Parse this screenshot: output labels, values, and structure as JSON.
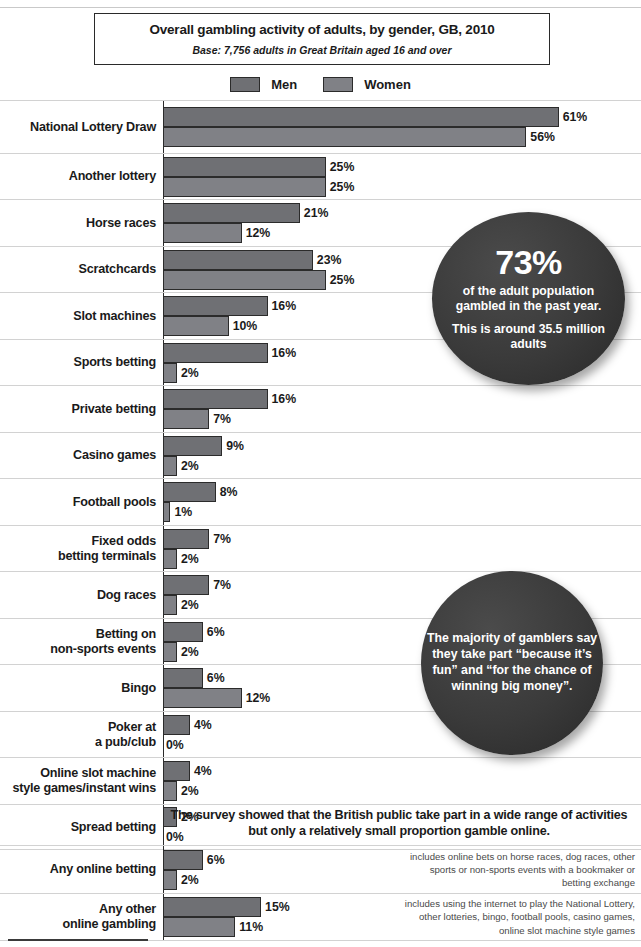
{
  "title": {
    "main": "Overall gambling activity of adults, by gender, GB, 2010",
    "subtitle": "Base: 7,756 adults in Great Britain aged 16 and over"
  },
  "legend": {
    "men_label": "Men",
    "women_label": "Women",
    "men_color": "#6f7074",
    "women_color": "#808186"
  },
  "callouts": [
    {
      "id": "callout-1",
      "big": "73%",
      "line1": "of the adult population gambled in the past year.",
      "line2": "This is around 35.5 million adults"
    },
    {
      "id": "callout-2",
      "big": "",
      "line1": "The majority of gamblers say they take part “because it’s fun” and “for the chance of winning big money”.",
      "line2": ""
    }
  ],
  "online_note": "The survey showed that the British public take part in a wide range of activities but only a relatively small proportion gamble online.",
  "chart_data": {
    "type": "bar",
    "orientation": "horizontal",
    "title": "Overall gambling activity of adults, by gender, GB, 2010",
    "subtitle": "Base: 7,756 adults in Great Britain aged 16 and over",
    "xlabel": "",
    "ylabel": "",
    "xlim": [
      0,
      61
    ],
    "grid": true,
    "legend_position": "top-center",
    "value_suffix": "%",
    "categories": [
      "National Lottery Draw",
      "Another lottery",
      "Horse races",
      "Scratchcards",
      "Slot machines",
      "Sports betting",
      "Private betting",
      "Casino games",
      "Football pools",
      "Fixed odds betting terminals",
      "Dog races",
      "Betting on non-sports events",
      "Bingo",
      "Poker at a pub/club",
      "Online slot machine style games/instant wins",
      "Spread betting"
    ],
    "series": [
      {
        "name": "Men",
        "values": [
          61,
          25,
          21,
          23,
          16,
          16,
          16,
          9,
          8,
          7,
          7,
          6,
          6,
          4,
          4,
          2
        ]
      },
      {
        "name": "Women",
        "values": [
          56,
          25,
          12,
          25,
          10,
          2,
          7,
          2,
          1,
          2,
          2,
          2,
          12,
          0,
          2,
          0
        ]
      }
    ],
    "online_section": {
      "categories": [
        "Any online betting",
        "Any other online gambling"
      ],
      "series": [
        {
          "name": "Men",
          "values": [
            6,
            15
          ]
        },
        {
          "name": "Women",
          "values": [
            2,
            11
          ]
        }
      ],
      "notes": [
        "includes online bets on horse races, dog races, other sports or non-sports events with a bookmaker or betting exchange",
        "includes using the internet to play the National Lottery, other lotteries, bingo, football pools, casino games, online slot machine style games"
      ]
    }
  },
  "rows": [
    {
      "label_l1": "National Lottery Draw",
      "label_l2": "",
      "men": 61,
      "women": 56,
      "men_text": "61%",
      "women_text": "56%",
      "height": 53
    },
    {
      "label_l1": "Another lottery",
      "label_l2": "",
      "men": 25,
      "women": 25,
      "men_text": "25%",
      "women_text": "25%",
      "height": 46
    },
    {
      "label_l1": "Horse races",
      "label_l2": "",
      "men": 21,
      "women": 12,
      "men_text": "21%",
      "women_text": "12%",
      "height": 47
    },
    {
      "label_l1": "Scratchcards",
      "label_l2": "",
      "men": 23,
      "women": 25,
      "men_text": "23%",
      "women_text": "25%",
      "height": 46
    },
    {
      "label_l1": "Slot machines",
      "label_l2": "",
      "men": 16,
      "women": 10,
      "men_text": "16%",
      "women_text": "10%",
      "height": 47
    },
    {
      "label_l1": "Sports betting",
      "label_l2": "",
      "men": 16,
      "women": 2,
      "men_text": "16%",
      "women_text": "2%",
      "height": 46
    },
    {
      "label_l1": "Private betting",
      "label_l2": "",
      "men": 16,
      "women": 7,
      "men_text": "16%",
      "women_text": "7%",
      "height": 47
    },
    {
      "label_l1": "Casino games",
      "label_l2": "",
      "men": 9,
      "women": 2,
      "men_text": "9%",
      "women_text": "2%",
      "height": 46
    },
    {
      "label_l1": "Football pools",
      "label_l2": "",
      "men": 8,
      "women": 1,
      "men_text": "8%",
      "women_text": "1%",
      "height": 47
    },
    {
      "label_l1": "Fixed odds",
      "label_l2": "betting terminals",
      "men": 7,
      "women": 2,
      "men_text": "7%",
      "women_text": "2%",
      "height": 46
    },
    {
      "label_l1": "Dog races",
      "label_l2": "",
      "men": 7,
      "women": 2,
      "men_text": "7%",
      "women_text": "2%",
      "height": 47
    },
    {
      "label_l1": "Betting on",
      "label_l2": "non-sports events",
      "men": 6,
      "women": 2,
      "men_text": "6%",
      "women_text": "2%",
      "height": 46
    },
    {
      "label_l1": "Bingo",
      "label_l2": "",
      "men": 6,
      "women": 12,
      "men_text": "6%",
      "women_text": "12%",
      "height": 47
    },
    {
      "label_l1": "Poker at",
      "label_l2": "a pub/club",
      "men": 4,
      "women": 0,
      "men_text": "4%",
      "women_text": "0%",
      "height": 46
    },
    {
      "label_l1": "Online slot machine",
      "label_l2": "style games/instant wins",
      "men": 4,
      "women": 2,
      "men_text": "4%",
      "women_text": "2%",
      "height": 47
    },
    {
      "label_l1": "Spread betting",
      "label_l2": "",
      "men": 2,
      "women": 0,
      "men_text": "2%",
      "women_text": "0%",
      "height": 46
    }
  ],
  "online_rows": [
    {
      "label_l1": "Any online betting",
      "label_l2": "",
      "men": 6,
      "women": 2,
      "men_text": "6%",
      "women_text": "2%",
      "note": "includes online bets on horse races, dog races, other sports or non-sports events with a bookmaker or betting exchange",
      "height": 48
    },
    {
      "label_l1": "Any other",
      "label_l2": "online gambling",
      "men": 15,
      "women": 11,
      "men_text": "15%",
      "women_text": "11%",
      "note": "includes using the internet to play the National Lottery, other lotteries, bingo, football pools, casino games, online slot machine style games",
      "height": 48
    }
  ]
}
